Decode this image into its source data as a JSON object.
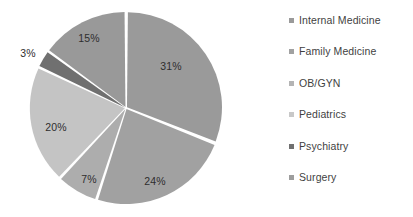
{
  "chart_data": {
    "type": "pie",
    "title": "",
    "labels": [
      "Internal Medicine",
      "Family Medicine",
      "OB/GYN",
      "Pediatrics",
      "Psychiatry",
      "Surgery"
    ],
    "values": [
      31,
      24,
      7,
      20,
      3,
      15
    ],
    "value_labels": [
      "31%",
      "24%",
      "7%",
      "20%",
      "3%",
      "15%"
    ],
    "unit": "%",
    "total": 100,
    "colors": [
      "#9a9a9a",
      "#a1a1a1",
      "#adadad",
      "#c4c4c4",
      "#707070",
      "#999999"
    ],
    "legend_position": "right",
    "grid": false,
    "start_angle_deg": 0,
    "direction": "clockwise",
    "separator_color": "#ffffff",
    "label_text_color": "#2e2e2e",
    "legend_text_color": "#3f3f3f",
    "background": "#ffffff",
    "slices": [
      {
        "label": "Internal Medicine",
        "value": 31,
        "value_label": "31%",
        "color": "#9a9a9a",
        "label_x": 171,
        "label_y": 66
      },
      {
        "label": "Family Medicine",
        "value": 24,
        "value_label": "24%",
        "color": "#a1a1a1",
        "label_x": 155,
        "label_y": 181
      },
      {
        "label": "OB/GYN",
        "value": 7,
        "value_label": "7%",
        "color": "#adadad",
        "label_x": 89,
        "label_y": 179
      },
      {
        "label": "Pediatrics",
        "value": 20,
        "value_label": "20%",
        "color": "#c4c4c4",
        "label_x": 56,
        "label_y": 127
      },
      {
        "label": "Psychiatry",
        "value": 3,
        "value_label": "3%",
        "color": "#707070",
        "label_x": 28,
        "label_y": 53
      },
      {
        "label": "Surgery",
        "value": 15,
        "value_label": "15%",
        "color": "#999999",
        "label_x": 89,
        "label_y": 38
      }
    ]
  },
  "legend": {
    "items": [
      {
        "label": "Internal Medicine",
        "color": "#9a9a9a"
      },
      {
        "label": "Family Medicine",
        "color": "#a1a1a1"
      },
      {
        "label": "OB/GYN",
        "color": "#b4b4b4"
      },
      {
        "label": "Pediatrics",
        "color": "#c8c8c8"
      },
      {
        "label": "Psychiatry",
        "color": "#707070"
      },
      {
        "label": "Surgery",
        "color": "#9d9d9d"
      }
    ]
  },
  "geometry": {
    "center_x": 126,
    "center_y": 108,
    "radius": 95
  }
}
